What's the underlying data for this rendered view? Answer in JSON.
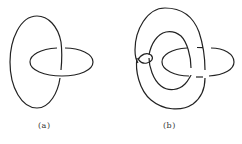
{
  "figure": {
    "panels": [
      {
        "label": "(a)",
        "description": "Hopf link: vertical ellipse linked with horizontal ellipse"
      },
      {
        "label": "(b)",
        "description": "Twisted torus-like loop linked with horizontal ellipse"
      }
    ],
    "stroke_color": "#222222",
    "background": "#ffffff"
  }
}
